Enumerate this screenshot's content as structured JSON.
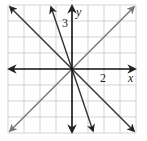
{
  "figure": {
    "type": "coordinate-plane",
    "axes": {
      "x_label": "x",
      "y_label": "y",
      "x_tick_label": "2",
      "y_tick_label": "3"
    },
    "grid": {
      "cells_per_side": 8,
      "range": [
        -4,
        4
      ]
    },
    "lines": [
      {
        "name": "line-y-equals-x",
        "equation": "y = x",
        "color": "#777777"
      },
      {
        "name": "line-y-equals-neg-x",
        "equation": "y = -x",
        "color": "#333333"
      },
      {
        "name": "line-y-equals-neg-3x",
        "equation": "y = -3x",
        "color": "#333333"
      }
    ],
    "colors": {
      "grid": "#c8c8c8",
      "axis": "#111111",
      "background": "#ffffff"
    }
  }
}
